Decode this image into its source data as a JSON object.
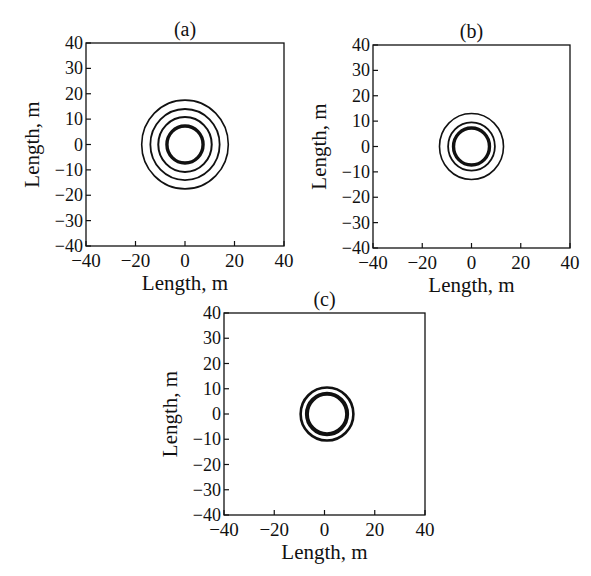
{
  "figure": {
    "background": "#ffffff",
    "line_color": "#111111"
  },
  "chart_data": [
    {
      "type": "line",
      "panel": "a",
      "title": "(a)",
      "xlabel": "Length, m",
      "ylabel": "Length, m",
      "xlim": [
        -40,
        40
      ],
      "ylim": [
        -40,
        40
      ],
      "xticks": [
        -40,
        -20,
        0,
        20,
        40
      ],
      "yticks": [
        -40,
        -30,
        -20,
        -10,
        0,
        10,
        20,
        30,
        40
      ],
      "xtick_labels": [
        "−40",
        "−20",
        "0",
        "20",
        "40"
      ],
      "ytick_labels": [
        "−40",
        "−30",
        "−20",
        "−10",
        "0",
        "10",
        "20",
        "30",
        "40"
      ],
      "grid": false,
      "box": {
        "x": 86,
        "y": 43,
        "w": 198,
        "h": 203
      },
      "contours": [
        {
          "cx": 0,
          "cy": 0,
          "r": 17.5,
          "width": 1.6
        },
        {
          "cx": 0,
          "cy": 0,
          "r": 14.0,
          "width": 1.8
        },
        {
          "cx": 0,
          "cy": 0,
          "r": 10.8,
          "width": 2.0
        },
        {
          "cx": 0,
          "cy": 0,
          "r": 7.3,
          "width": 3.4
        }
      ]
    },
    {
      "type": "line",
      "panel": "b",
      "title": "(b)",
      "xlabel": "Length, m",
      "ylabel": "Length, m",
      "xlim": [
        -40,
        40
      ],
      "ylim": [
        -40,
        40
      ],
      "xticks": [
        -40,
        -20,
        0,
        20,
        40
      ],
      "yticks": [
        -40,
        -30,
        -20,
        -10,
        0,
        10,
        20,
        30,
        40
      ],
      "xtick_labels": [
        "−40",
        "−20",
        "0",
        "20",
        "40"
      ],
      "ytick_labels": [
        "−40",
        "−30",
        "−20",
        "−10",
        "0",
        "10",
        "20",
        "30",
        "40"
      ],
      "grid": false,
      "box": {
        "x": 373,
        "y": 45,
        "w": 197,
        "h": 203
      },
      "contours": [
        {
          "cx": 0,
          "cy": 0,
          "r": 13.0,
          "width": 1.6
        },
        {
          "cx": 0,
          "cy": 0,
          "r": 9.5,
          "width": 1.8
        },
        {
          "cx": 0,
          "cy": 0,
          "r": 7.3,
          "width": 3.4
        }
      ]
    },
    {
      "type": "line",
      "panel": "c",
      "title": "(c)",
      "xlabel": "Length, m",
      "ylabel": "Length, m",
      "xlim": [
        -40,
        40
      ],
      "ylim": [
        -40,
        40
      ],
      "xticks": [
        -40,
        -20,
        0,
        20,
        40
      ],
      "yticks": [
        -40,
        -30,
        -20,
        -10,
        0,
        10,
        20,
        30,
        40
      ],
      "xtick_labels": [
        "−40",
        "−20",
        "0",
        "20",
        "40"
      ],
      "ytick_labels": [
        "−40",
        "−30",
        "−20",
        "−10",
        "0",
        "10",
        "20",
        "30",
        "40"
      ],
      "grid": false,
      "box": {
        "x": 224,
        "y": 313,
        "w": 201,
        "h": 202
      },
      "contours": [
        {
          "cx": 1,
          "cy": 0,
          "r": 10.5,
          "width": 2.6
        },
        {
          "cx": 1,
          "cy": 0,
          "r": 8.0,
          "width": 4.0
        }
      ]
    }
  ]
}
